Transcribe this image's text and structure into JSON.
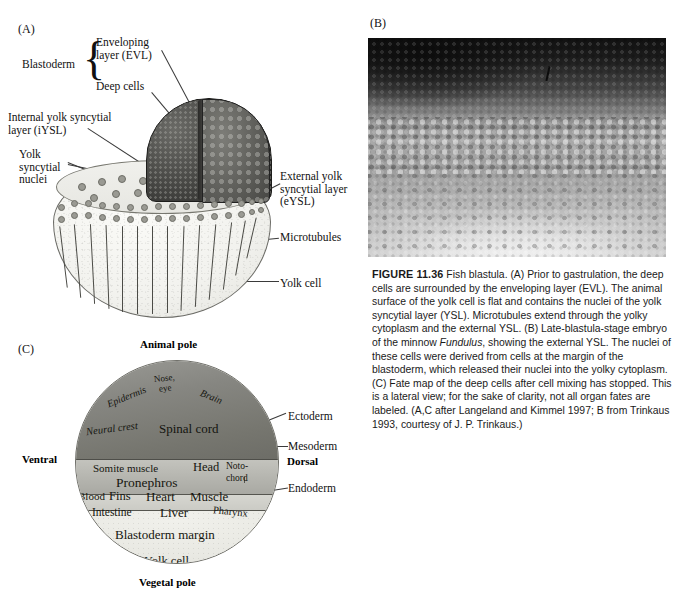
{
  "figure": {
    "number": "FIGURE 11.36",
    "caption_parts": [
      {
        "type": "bold",
        "text": "FIGURE 11.36"
      },
      {
        "type": "text",
        "text": "  Fish blastula. (A) Prior to gastrulation, the deep cells are surrounded by the enveloping layer (EVL). The animal surface of the yolk cell is flat and contains the nuclei of the yolk syncytial layer (YSL). Microtubules extend through the yolky cytoplasm and the external YSL. (B) Late-blastula-stage embryo of the minnow "
      },
      {
        "type": "italic",
        "text": "Fundulus"
      },
      {
        "type": "text",
        "text": ", showing the external YSL. The nuclei of these cells were derived from cells at the margin of the blastoderm, which released their nuclei into the yolky cytoplasm. (C) Fate map of the deep cells after cell mixing has stopped. This is a lateral view; for the sake of clarity, not all organ fates are labeled. (A,C after Langeland and Kimmel 1997; B from Trinkaus 1993, courtesy of J. P. Trinkaus.)"
      }
    ]
  },
  "panelA": {
    "id": "(A)",
    "labels": {
      "blastoderm": "Blastoderm",
      "enveloping_layer": "Enveloping\nlayer (EVL)",
      "deep_cells": "Deep cells",
      "internal_ysl": "Internal yolk syncytial\nlayer (iYSL)",
      "yolk_syncytial_nuclei": "Yolk\nsyncytial\nnuclei",
      "external_ysl": "External yolk\nsyncytial layer\n(eYSL)",
      "microtubules": "Microtubules",
      "yolk_cell": "Yolk cell"
    }
  },
  "panelB": {
    "id": "(B)",
    "description": "Late-blastula-stage Fundulus embryo micrograph"
  },
  "panelC": {
    "id": "(C)",
    "axis_labels": {
      "animal_pole": "Animal pole",
      "vegetal_pole": "Vegetal pole",
      "ventral": "Ventral",
      "dorsal": "Dorsal"
    },
    "germ_layers": [
      {
        "name": "Ectoderm",
        "color": "#7c7c76"
      },
      {
        "name": "Mesoderm",
        "color": "#b6b6b0"
      },
      {
        "name": "Endoderm",
        "color": "#d2d2cc"
      }
    ],
    "fates": {
      "ectoderm": [
        "Nose,",
        "eye",
        "Epidermis",
        "Brain",
        "Neural crest",
        "Spinal cord"
      ],
      "mesoderm": [
        "Somite muscle",
        "Head",
        "Pronephros",
        "Noto-",
        "chord",
        "Blood",
        "Fins",
        "Heart",
        "Muscle"
      ],
      "endoderm": [
        "Intestine",
        "Liver",
        "Pharynx"
      ],
      "yolk": [
        "Blastoderm margin",
        "Yolk cell"
      ]
    },
    "fate_items": {
      "nose": "Nose,",
      "eye": "eye",
      "epidermis": "Epidermis",
      "brain": "Brain",
      "neural_crest": "Neural crest",
      "spinal_cord": "Spinal cord",
      "somite_muscle": "Somite muscle",
      "head": "Head",
      "pronephros": "Pronephros",
      "noto": "Noto-",
      "chord": "chord",
      "blood": "Blood",
      "fins": "Fins",
      "heart": "Heart",
      "muscle": "Muscle",
      "intestine": "Intestine",
      "liver": "Liver",
      "pharynx": "Pharynx",
      "blastoderm_margin": "Blastoderm margin",
      "yolk_cell": "Yolk cell"
    },
    "layer_labels": {
      "ectoderm": "Ectoderm",
      "mesoderm": "Mesoderm",
      "endoderm": "Endoderm"
    }
  }
}
